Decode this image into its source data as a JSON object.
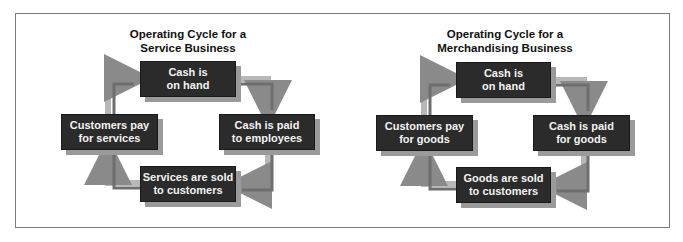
{
  "figure": {
    "left": {
      "title_line1": "Operating Cycle for a",
      "title_line2": "Service Business",
      "boxes": {
        "top": {
          "line1": "Cash is",
          "line2": "on hand"
        },
        "right": {
          "line1": "Cash is paid",
          "line2": "to employees"
        },
        "bottom": {
          "line1": "Services are sold",
          "line2": "to customers"
        },
        "left": {
          "line1": "Customers pay",
          "line2": "for services"
        }
      }
    },
    "right": {
      "title_line1": "Operating Cycle for a",
      "title_line2": "Merchandising Business",
      "boxes": {
        "top": {
          "line1": "Cash is",
          "line2": "on hand"
        },
        "right": {
          "line1": "Cash is paid",
          "line2": "for goods"
        },
        "bottom": {
          "line1": "Goods are sold",
          "line2": "to customers"
        },
        "left": {
          "line1": "Customers pay",
          "line2": "for goods"
        }
      }
    },
    "colors": {
      "box_fill": "#2b2b2b",
      "box_text": "#f2f2f2",
      "box_shadow": "#9a9a9a",
      "arrow_light": "#b8b8b8",
      "arrow_dark": "#6e6e6e",
      "frame": "#7a7a7a"
    }
  }
}
